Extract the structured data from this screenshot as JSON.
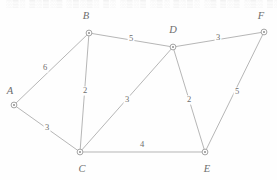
{
  "figure": {
    "top_text_fragment": "░▒░ ▒░▒░▒ ░▒░▒░ ▒░ ░▒░▒ ░▒░ ▒░▒░ ░▒ ▒░▒ ░▒░ ▒░▒",
    "colors": {
      "background": "#fefefe",
      "edge": "#a9a9a9",
      "node_stroke": "#9a9a9a",
      "node_fill": "#ffffff",
      "node_center": "#8f8f8f",
      "text": "#6d6d6d"
    }
  },
  "chart_data": {
    "type": "diagram",
    "nodes": [
      {
        "id": "A",
        "label": "A",
        "x": 14,
        "y": 105,
        "label_x": 10,
        "label_y": 92
      },
      {
        "id": "B",
        "label": "B",
        "x": 89,
        "y": 33,
        "label_x": 86,
        "label_y": 17
      },
      {
        "id": "C",
        "label": "C",
        "x": 80,
        "y": 152,
        "label_x": 82,
        "label_y": 170
      },
      {
        "id": "D",
        "label": "D",
        "x": 173,
        "y": 47,
        "label_x": 173,
        "label_y": 31
      },
      {
        "id": "E",
        "label": "E",
        "x": 205,
        "y": 152,
        "label_x": 207,
        "label_y": 170
      },
      {
        "id": "F",
        "label": "F",
        "x": 264,
        "y": 32,
        "label_x": 261,
        "label_y": 17
      }
    ],
    "edges": [
      {
        "from": "A",
        "to": "B",
        "weight": "6",
        "label_x": 45,
        "label_y": 68
      },
      {
        "from": "A",
        "to": "C",
        "weight": "3",
        "label_x": 47,
        "label_y": 128
      },
      {
        "from": "B",
        "to": "C",
        "weight": "2",
        "label_x": 85,
        "label_y": 91
      },
      {
        "from": "B",
        "to": "D",
        "weight": "5",
        "label_x": 131,
        "label_y": 39
      },
      {
        "from": "C",
        "to": "D",
        "weight": "3",
        "label_x": 127,
        "label_y": 100
      },
      {
        "from": "C",
        "to": "E",
        "weight": "4",
        "label_x": 142,
        "label_y": 145
      },
      {
        "from": "D",
        "to": "E",
        "weight": "2",
        "label_x": 189,
        "label_y": 100
      },
      {
        "from": "D",
        "to": "F",
        "weight": "3",
        "label_x": 218,
        "label_y": 38
      },
      {
        "from": "E",
        "to": "F",
        "weight": "5",
        "label_x": 237,
        "label_y": 92
      }
    ]
  }
}
